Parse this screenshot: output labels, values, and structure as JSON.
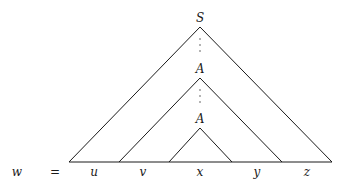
{
  "diagram": {
    "nodes": {
      "root": "S",
      "repeated_upper": "A",
      "repeated_lower": "A"
    },
    "equation": {
      "lhs": "w",
      "op": "="
    },
    "segments": [
      "u",
      "v",
      "x",
      "y",
      "z"
    ],
    "ellipsis": "⋮",
    "colors": {
      "ink": "#1a1a1a",
      "background": "#ffffff"
    }
  }
}
